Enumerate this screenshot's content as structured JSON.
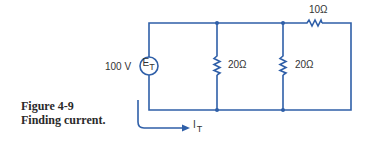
{
  "figure": {
    "number_label": "Figure 4-9",
    "title": "Finding current."
  },
  "circuit": {
    "source": {
      "symbol": "E",
      "subscript": "T",
      "value_label": "100 V"
    },
    "resistors": [
      {
        "id": "R1",
        "label": "20Ω",
        "orientation": "vertical",
        "branch": "parallel-1"
      },
      {
        "id": "R2",
        "label": "20Ω",
        "orientation": "vertical",
        "branch": "parallel-2"
      },
      {
        "id": "R3",
        "label": "10Ω",
        "orientation": "horizontal",
        "branch": "series-top-right"
      }
    ],
    "current": {
      "symbol": "I",
      "subscript": "T"
    },
    "colors": {
      "wire": "#2f5fa8",
      "text": "#333333"
    }
  }
}
